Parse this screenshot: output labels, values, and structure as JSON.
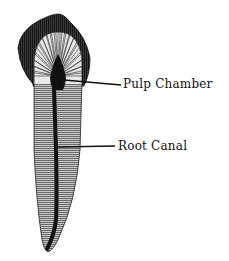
{
  "diagram": {
    "labels": [
      {
        "id": "pulp-chamber",
        "text": "Pulp Chamber"
      },
      {
        "id": "root-canal",
        "text": "Root Canal"
      }
    ],
    "colors": {
      "background": "#ffffff",
      "crown_dark": "#2a2a2a",
      "hatch_fill": "#9a9a9a",
      "canal": "#111111",
      "leader_line": "#111111"
    }
  }
}
